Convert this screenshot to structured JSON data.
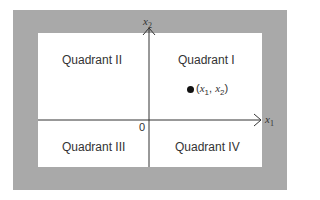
{
  "diagram": {
    "type": "cartesian-plane",
    "quadrants": [
      {
        "id": "I",
        "label": "Quadrant I"
      },
      {
        "id": "II",
        "label": "Quadrant II"
      },
      {
        "id": "III",
        "label": "Quadrant III"
      },
      {
        "id": "IV",
        "label": "Quadrant IV"
      }
    ],
    "axes": {
      "horizontal": {
        "var": "x",
        "sub": "1"
      },
      "vertical": {
        "var": "x",
        "sub": "2"
      },
      "origin": "0"
    },
    "point": {
      "open": "(",
      "v1": "x",
      "s1": "1",
      "sep": ", ",
      "v2": "x",
      "s2": "2",
      "close": ")"
    },
    "colors": {
      "frame": "#a9a9a9",
      "panel": "#ffffff",
      "axis": "#333333",
      "point": "#111111"
    }
  }
}
